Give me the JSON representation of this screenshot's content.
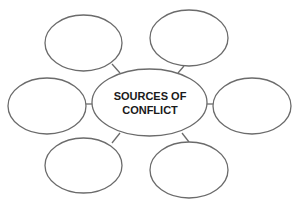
{
  "diagram": {
    "type": "spider-map",
    "center": {
      "label_lines": [
        "SOURCES OF",
        "CONFLICT"
      ],
      "cx": 149.5,
      "cy": 102.5,
      "rx": 57.5,
      "ry": 33.5
    },
    "bubbles": [
      {
        "name": "top-left",
        "label": "",
        "cx": 83.5,
        "cy": 43,
        "rx": 38.5,
        "ry": 28
      },
      {
        "name": "top-right",
        "label": "",
        "cx": 189,
        "cy": 38,
        "rx": 39,
        "ry": 28
      },
      {
        "name": "left",
        "label": "",
        "cx": 47,
        "cy": 106,
        "rx": 39,
        "ry": 28
      },
      {
        "name": "right",
        "label": "",
        "cx": 252,
        "cy": 106,
        "rx": 39,
        "ry": 28
      },
      {
        "name": "bottom-left",
        "label": "",
        "cx": 83.5,
        "cy": 165.5,
        "rx": 38.5,
        "ry": 27.5
      },
      {
        "name": "bottom-right",
        "label": "",
        "cx": 189,
        "cy": 170,
        "rx": 39,
        "ry": 28
      }
    ],
    "colors": {
      "stroke": "#6b6b6b",
      "text": "#1a1a1a",
      "background": "#ffffff"
    }
  }
}
